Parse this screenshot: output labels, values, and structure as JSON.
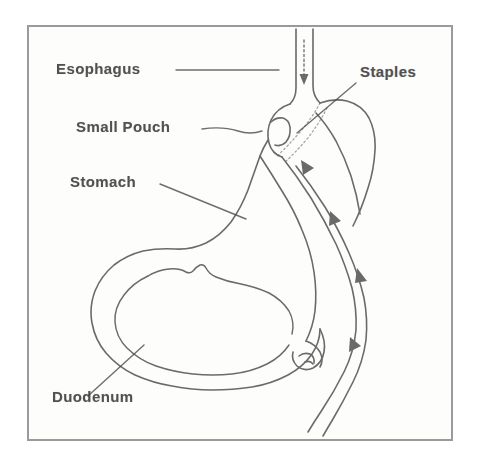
{
  "figure": {
    "frame_color": "#9a9a9a",
    "background_color": "#fdfdfc",
    "ink_color": "#4a4a4a",
    "text_color": "#3a3a3a"
  },
  "labels": {
    "esophagus": "Esophagus",
    "small_pouch": "Small Pouch",
    "stomach": "Stomach",
    "duodenum": "Duodenum",
    "staples": "Staples"
  },
  "diagram_parts": {
    "esophagus_tube": "esophagus-tube",
    "flow_arrow_esophagus": "flow-arrow-down",
    "gastric_pouch": "small-gastric-pouch",
    "staple_line": "staple-line-dotted",
    "bypassed_stomach": "bypassed-stomach-remnant",
    "stomach_outline": "stomach-outline",
    "stomach_inner_lining": "stomach-inner-lining",
    "duodenum_loop": "duodenum-loop",
    "roux_limb": "roux-limb-jejunum",
    "flow_arrows": "flow-arrows-roux-limb"
  },
  "leader_lines": {
    "esophagus": "horizontal-leader",
    "small_pouch": "wavy-leader",
    "stomach": "diagonal-leader",
    "duodenum": "diagonal-leader",
    "staples": "diagonal-leader"
  }
}
